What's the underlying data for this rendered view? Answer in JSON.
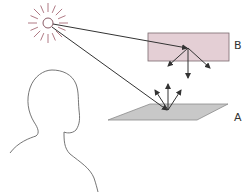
{
  "diagram": {
    "labels": {
      "surface_b": "B",
      "surface_a": "A"
    },
    "elements": {
      "light_source": "sun-icon",
      "observer": "person-silhouette",
      "surface_b_desc": "rectangular surface B receiving light and scattering it downward",
      "surface_a_desc": "flat plane A receiving direct light and scattering it upward"
    },
    "colors": {
      "sun_rays": "#b07a85",
      "surface_b_fill": "#e4cfd5",
      "surface_b_stroke": "#7a6a6e",
      "surface_a_fill": "#c8c8c8",
      "surface_a_stroke": "#8a8a8a",
      "lines": "#333333",
      "outline": "#666666"
    }
  }
}
